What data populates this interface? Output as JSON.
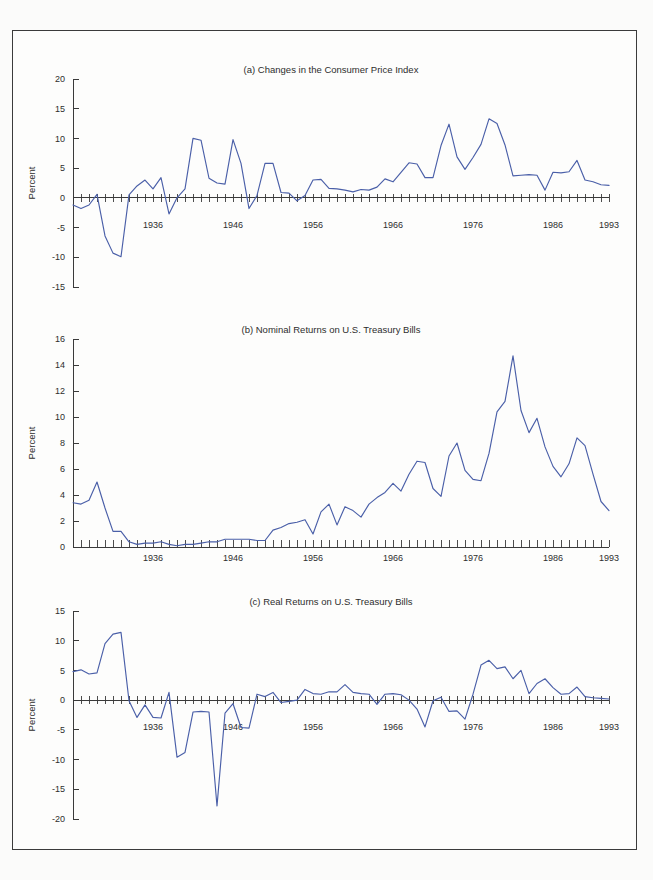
{
  "figure": {
    "background_color": "#fdfdfc",
    "line_color": "#4a5fa8",
    "axis_color": "#3a3a3a",
    "axis_name": "Percent"
  },
  "chart_data": [
    {
      "type": "line",
      "panel": "a",
      "title": "(a) Changes in the Consumer Price Index",
      "xlabel": "",
      "ylabel": "Percent",
      "xlim": [
        1926,
        1993
      ],
      "ylim": [
        -15,
        20
      ],
      "yticks": [
        -15,
        -10,
        -5,
        0,
        5,
        10,
        15,
        20
      ],
      "ytick_labels": [
        "-15",
        "-10",
        "-5",
        "0",
        "5",
        "10",
        "15",
        "20"
      ],
      "xticks": [
        1936,
        1946,
        1956,
        1966,
        1976,
        1986,
        1993
      ],
      "xtick_labels": [
        "1936",
        "1946",
        "1956",
        "1966",
        "1976",
        "1986",
        "1993"
      ],
      "grid": false,
      "legend": "none",
      "x": [
        1926,
        1927,
        1928,
        1929,
        1930,
        1931,
        1932,
        1933,
        1934,
        1935,
        1936,
        1937,
        1938,
        1939,
        1940,
        1941,
        1942,
        1943,
        1944,
        1945,
        1946,
        1947,
        1948,
        1949,
        1950,
        1951,
        1952,
        1953,
        1954,
        1955,
        1956,
        1957,
        1958,
        1959,
        1960,
        1961,
        1962,
        1963,
        1964,
        1965,
        1966,
        1967,
        1968,
        1969,
        1970,
        1971,
        1972,
        1973,
        1974,
        1975,
        1976,
        1977,
        1978,
        1979,
        1980,
        1981,
        1982,
        1983,
        1984,
        1985,
        1986,
        1987,
        1988,
        1989,
        1990,
        1991,
        1992,
        1993
      ],
      "values": [
        -1.2,
        -1.8,
        -1.2,
        0.6,
        -6.4,
        -9.3,
        -9.9,
        0.5,
        2.0,
        3.0,
        1.5,
        3.4,
        -2.7,
        0.0,
        1.5,
        10.0,
        9.7,
        3.3,
        2.5,
        2.3,
        9.8,
        5.8,
        -1.8,
        0.4,
        5.8,
        5.8,
        0.9,
        0.8,
        -0.5,
        0.4,
        3.0,
        3.1,
        1.6,
        1.5,
        1.3,
        1.0,
        1.4,
        1.3,
        1.8,
        3.2,
        2.7,
        4.3,
        5.9,
        5.7,
        3.4,
        3.4,
        8.8,
        12.4,
        6.9,
        4.8,
        6.8,
        9.0,
        13.3,
        12.5,
        8.9,
        3.7,
        3.8,
        3.9,
        3.8,
        1.3,
        4.3,
        4.2,
        4.4,
        6.3,
        3.0,
        2.7,
        2.2,
        2.1
      ]
    },
    {
      "type": "line",
      "panel": "b",
      "title": "(b) Nominal Returns on U.S. Treasury Bills",
      "xlabel": "",
      "ylabel": "Percent",
      "xlim": [
        1926,
        1993
      ],
      "ylim": [
        0,
        16
      ],
      "yticks": [
        0,
        2,
        4,
        6,
        8,
        10,
        12,
        14,
        16
      ],
      "ytick_labels": [
        "0",
        "2",
        "4",
        "6",
        "8",
        "10",
        "12",
        "14",
        "16"
      ],
      "xticks": [
        1936,
        1946,
        1956,
        1966,
        1976,
        1986,
        1993
      ],
      "xtick_labels": [
        "1936",
        "1946",
        "1956",
        "1966",
        "1976",
        "1986",
        "1993"
      ],
      "grid": false,
      "legend": "none",
      "x": [
        1926,
        1927,
        1928,
        1929,
        1930,
        1931,
        1932,
        1933,
        1934,
        1935,
        1936,
        1937,
        1938,
        1939,
        1940,
        1941,
        1942,
        1943,
        1944,
        1945,
        1946,
        1947,
        1948,
        1949,
        1950,
        1951,
        1952,
        1953,
        1954,
        1955,
        1956,
        1957,
        1958,
        1959,
        1960,
        1961,
        1962,
        1963,
        1964,
        1965,
        1966,
        1967,
        1968,
        1969,
        1970,
        1971,
        1972,
        1973,
        1974,
        1975,
        1976,
        1977,
        1978,
        1979,
        1980,
        1981,
        1982,
        1983,
        1984,
        1985,
        1986,
        1987,
        1988,
        1989,
        1990,
        1991,
        1992,
        1993
      ],
      "values": [
        3.4,
        3.3,
        3.6,
        5.0,
        3.0,
        1.2,
        1.2,
        0.4,
        0.2,
        0.3,
        0.3,
        0.4,
        0.2,
        0.1,
        0.2,
        0.2,
        0.3,
        0.4,
        0.4,
        0.6,
        0.6,
        0.6,
        0.6,
        0.5,
        0.5,
        1.3,
        1.5,
        1.8,
        1.9,
        2.1,
        1.0,
        2.7,
        3.3,
        1.7,
        3.1,
        2.8,
        2.3,
        3.3,
        3.8,
        4.2,
        4.9,
        4.3,
        5.6,
        6.6,
        6.5,
        4.5,
        3.9,
        7.0,
        8.0,
        5.9,
        5.2,
        5.1,
        7.2,
        10.4,
        11.2,
        14.7,
        10.5,
        8.8,
        9.9,
        7.7,
        6.2,
        5.4,
        6.4,
        8.4,
        7.8,
        5.6,
        3.5,
        2.8
      ]
    },
    {
      "type": "line",
      "panel": "c",
      "title": "(c) Real Returns on U.S. Treasury Bills",
      "xlabel": "",
      "ylabel": "Percent",
      "xlim": [
        1926,
        1993
      ],
      "ylim": [
        -20,
        15
      ],
      "yticks": [
        -20,
        -15,
        -10,
        -5,
        0,
        5,
        10,
        15
      ],
      "ytick_labels": [
        "-20",
        "-15",
        "-10",
        "-5",
        "0",
        "5",
        "10",
        "15"
      ],
      "xticks": [
        1936,
        1946,
        1956,
        1966,
        1976,
        1986,
        1993
      ],
      "xtick_labels": [
        "1936",
        "1946",
        "1956",
        "1966",
        "1976",
        "1986",
        "1993"
      ],
      "grid": false,
      "legend": "none",
      "x": [
        1926,
        1927,
        1928,
        1929,
        1930,
        1931,
        1932,
        1933,
        1934,
        1935,
        1936,
        1937,
        1938,
        1939,
        1940,
        1941,
        1942,
        1943,
        1944,
        1945,
        1946,
        1947,
        1948,
        1949,
        1950,
        1951,
        1952,
        1953,
        1954,
        1955,
        1956,
        1957,
        1958,
        1959,
        1960,
        1961,
        1962,
        1963,
        1964,
        1965,
        1966,
        1967,
        1968,
        1969,
        1970,
        1971,
        1972,
        1973,
        1974,
        1975,
        1976,
        1977,
        1978,
        1979,
        1980,
        1981,
        1982,
        1983,
        1984,
        1985,
        1986,
        1987,
        1988,
        1989,
        1990,
        1991,
        1992,
        1993
      ],
      "values": [
        4.8,
        5.1,
        4.4,
        4.6,
        9.5,
        11.1,
        11.4,
        -0.1,
        -2.9,
        -0.8,
        -2.9,
        -3.0,
        1.3,
        -9.6,
        -8.8,
        -2.0,
        -1.9,
        -2.0,
        -17.8,
        -2.2,
        -0.6,
        -4.6,
        -4.7,
        1.0,
        0.6,
        1.3,
        -0.4,
        -0.2,
        0.0,
        1.8,
        1.1,
        1.0,
        1.4,
        1.4,
        2.6,
        1.3,
        1.1,
        1.0,
        -0.7,
        1.0,
        1.1,
        0.9,
        0.0,
        -1.5,
        -4.5,
        -0.1,
        0.5,
        -1.9,
        -1.8,
        -3.2,
        1.0,
        5.9,
        6.7,
        5.3,
        5.6,
        3.6,
        5.0,
        1.1,
        2.8,
        3.6,
        2.1,
        1.0,
        1.1,
        2.2,
        0.6,
        0.4,
        0.3,
        0.2
      ]
    }
  ]
}
